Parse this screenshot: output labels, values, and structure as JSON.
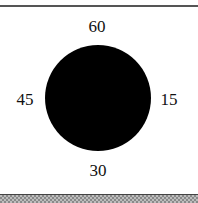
{
  "diagram": {
    "shape": "filled-circle",
    "fill_color": "#000000",
    "labels": {
      "top": "60",
      "right": "15",
      "bottom": "30",
      "left": "45"
    }
  },
  "frame": {
    "top_rule_color": "#555555",
    "bottom_band_color": "#bdbdbd"
  }
}
